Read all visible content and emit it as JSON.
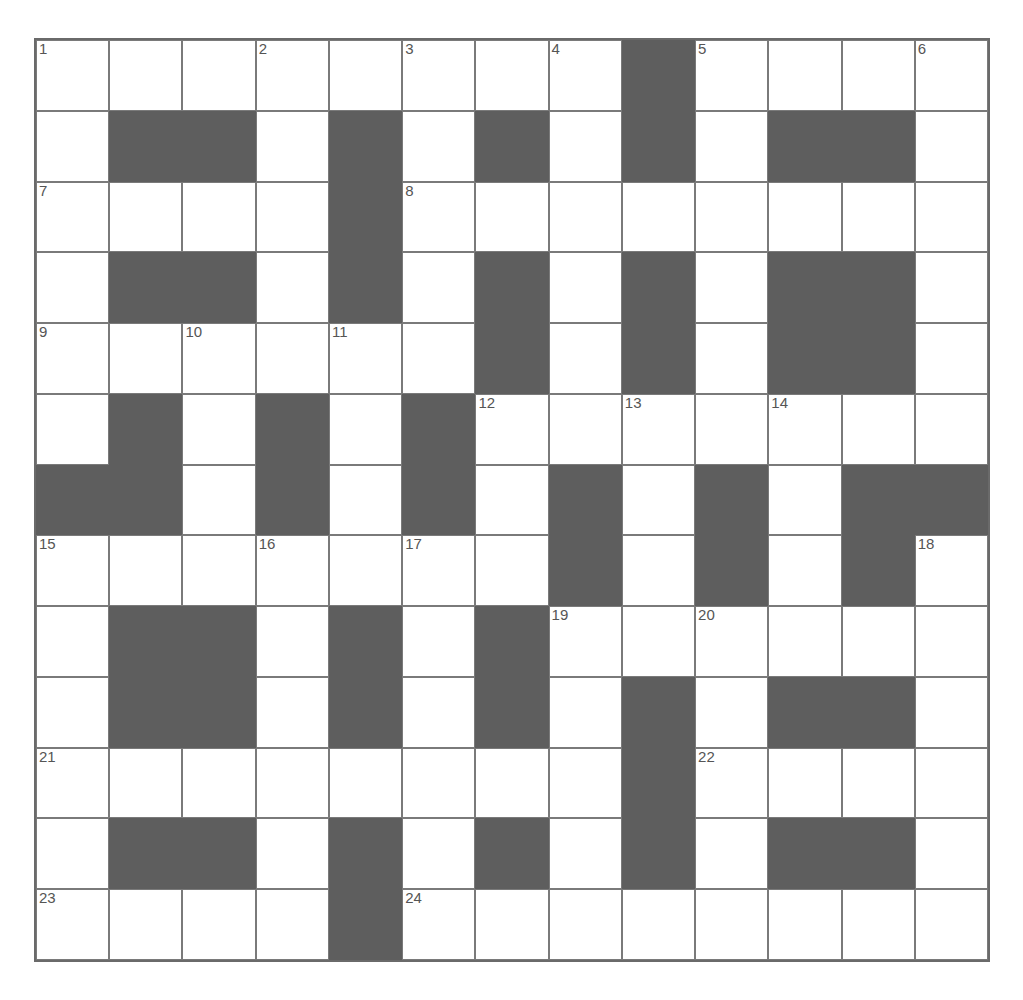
{
  "puzzle": {
    "rows": 13,
    "cols": 13,
    "colors": {
      "cell": "#ffffff",
      "block": "#5e5e5e",
      "line": "#7a7a7a",
      "number": "#555555"
    },
    "grid": [
      "........#....",
      ".##.#.#.#.##.",
      "....#........",
      ".##.#.#.#.##.",
      "......#.#.##.",
      ".#.#.#.......",
      "##.#.#.#.#.##",
      ".......#.#.#.",
      ".##.#.#......",
      ".##.#.#.#.##.",
      "........#....",
      ".##.#.#.#.##.",
      "....#........"
    ],
    "numbers": [
      {
        "r": 0,
        "c": 0,
        "n": "1"
      },
      {
        "r": 0,
        "c": 3,
        "n": "2"
      },
      {
        "r": 0,
        "c": 5,
        "n": "3"
      },
      {
        "r": 0,
        "c": 7,
        "n": "4"
      },
      {
        "r": 0,
        "c": 9,
        "n": "5"
      },
      {
        "r": 0,
        "c": 12,
        "n": "6"
      },
      {
        "r": 2,
        "c": 0,
        "n": "7"
      },
      {
        "r": 2,
        "c": 5,
        "n": "8"
      },
      {
        "r": 4,
        "c": 0,
        "n": "9"
      },
      {
        "r": 4,
        "c": 2,
        "n": "10"
      },
      {
        "r": 4,
        "c": 4,
        "n": "11"
      },
      {
        "r": 5,
        "c": 6,
        "n": "12"
      },
      {
        "r": 5,
        "c": 8,
        "n": "13"
      },
      {
        "r": 5,
        "c": 10,
        "n": "14"
      },
      {
        "r": 7,
        "c": 0,
        "n": "15"
      },
      {
        "r": 7,
        "c": 3,
        "n": "16"
      },
      {
        "r": 7,
        "c": 5,
        "n": "17"
      },
      {
        "r": 7,
        "c": 12,
        "n": "18"
      },
      {
        "r": 8,
        "c": 7,
        "n": "19"
      },
      {
        "r": 8,
        "c": 9,
        "n": "20"
      },
      {
        "r": 10,
        "c": 0,
        "n": "21"
      },
      {
        "r": 10,
        "c": 9,
        "n": "22"
      },
      {
        "r": 12,
        "c": 0,
        "n": "23"
      },
      {
        "r": 12,
        "c": 5,
        "n": "24"
      }
    ]
  }
}
